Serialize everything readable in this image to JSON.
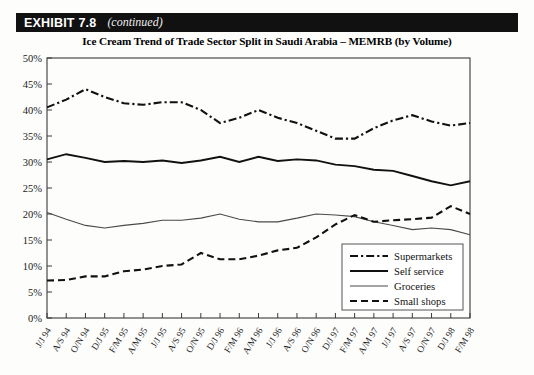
{
  "exhibit": {
    "label": "EXHIBIT 7.8",
    "continued": "(continued)"
  },
  "chart_data": {
    "type": "line",
    "title": "Ice Cream Trend of Trade Sector Split in Saudi Arabia – MEMRB (by  Volume)",
    "xlabel": "",
    "ylabel": "",
    "ylim": [
      0,
      50
    ],
    "ytick_labels": [
      "0%",
      "5%",
      "10%",
      "15%",
      "20%",
      "25%",
      "30%",
      "35%",
      "40%",
      "45%",
      "50%"
    ],
    "ytick_values": [
      0,
      5,
      10,
      15,
      20,
      25,
      30,
      35,
      40,
      45,
      50
    ],
    "grid": false,
    "legend_position": "bottom-right",
    "categories": [
      "J/J 94",
      "A/S 94",
      "O/N 94",
      "D/J 95",
      "F/M 95",
      "A/M 95",
      "J/J 95",
      "A/S 95",
      "O/N 95",
      "D/J 96",
      "F/M 96",
      "A/M 96",
      "J/J 96",
      "A/S 96",
      "O/N 96",
      "D/J 97",
      "F/M 97",
      "A/M 97",
      "J/J 97",
      "A/S 97",
      "O/N 97",
      "D/J 98",
      "F/M 98"
    ],
    "series": [
      {
        "name": "Supermarkets",
        "style": "dash-dot",
        "values": [
          40.5,
          42.0,
          44.0,
          42.5,
          41.3,
          41.0,
          41.5,
          41.5,
          40.0,
          37.5,
          38.5,
          40.0,
          38.5,
          37.5,
          36.0,
          34.5,
          34.5,
          36.5,
          38.0,
          39.0,
          37.8,
          37.0,
          37.5
        ]
      },
      {
        "name": "Self service",
        "style": "solid-thick",
        "values": [
          30.5,
          31.5,
          30.8,
          30.0,
          30.2,
          30.0,
          30.3,
          29.8,
          30.3,
          31.0,
          30.0,
          31.0,
          30.2,
          30.5,
          30.3,
          29.5,
          29.2,
          28.5,
          28.3,
          27.3,
          26.3,
          25.5,
          26.3
        ]
      },
      {
        "name": "Groceries",
        "style": "solid-thin",
        "values": [
          20.3,
          19.0,
          17.8,
          17.3,
          17.8,
          18.2,
          18.8,
          18.8,
          19.2,
          20.0,
          19.0,
          18.5,
          18.5,
          19.2,
          20.0,
          19.8,
          19.5,
          18.5,
          17.8,
          17.0,
          17.3,
          17.0,
          16.0
        ]
      },
      {
        "name": "Small shops",
        "style": "dashed",
        "values": [
          7.2,
          7.3,
          8.0,
          8.0,
          9.0,
          9.3,
          10.0,
          10.3,
          12.5,
          11.3,
          11.3,
          12.0,
          13.0,
          13.5,
          15.5,
          18.0,
          19.8,
          18.5,
          18.8,
          19.0,
          19.3,
          21.5,
          20.0
        ]
      }
    ]
  },
  "legend": {
    "items": [
      {
        "label": "Supermarkets"
      },
      {
        "label": "Self service"
      },
      {
        "label": "Groceries"
      },
      {
        "label": "Small shops"
      }
    ]
  }
}
